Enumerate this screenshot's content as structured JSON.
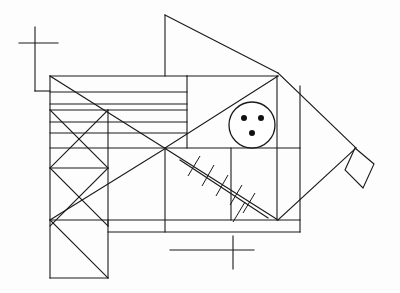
{
  "figure": {
    "background_color": "#fdfdfd",
    "stroke_color": "#1a1a1a",
    "canvas": {
      "width": 400,
      "height": 293
    },
    "parts": [
      {
        "name": "upper-left-cross-marker",
        "label": "cross"
      },
      {
        "name": "lower-cross-marker",
        "label": "cross"
      },
      {
        "name": "dorsal-fin",
        "label": "dorsal fin"
      },
      {
        "name": "body-outline",
        "label": "body"
      },
      {
        "name": "eye",
        "label": "eye"
      },
      {
        "name": "gill-hatching",
        "label": "hatched fin"
      },
      {
        "name": "tail-diamond",
        "label": "tail"
      },
      {
        "name": "pectoral-box",
        "label": "lower fin box"
      }
    ]
  },
  "geometry": {
    "cross_top": {
      "cx": 35,
      "cy": 43,
      "h_x1": 19,
      "h_x2": 58,
      "v_y1": 27,
      "v_y2": 91
    },
    "cross_top_stub": {
      "x1": 35,
      "y1": 91,
      "x2": 50,
      "y2": 91
    },
    "cross_bottom": {
      "cx": 233,
      "cy": 250,
      "h_x1": 196,
      "h_x2": 254,
      "v_y1": 236,
      "v_y2": 269
    },
    "cross_bottom_stub": {
      "x1": 196,
      "y1": 250,
      "x2": 170,
      "y2": 250
    },
    "body": {
      "top_y": 76,
      "mid_y": 148,
      "bottom_y": 220,
      "left_x": 50,
      "right_x": 300,
      "nose_x": 277,
      "nose_y": 73,
      "tail_x": 355,
      "tail_y": 148
    },
    "horizontal_lines": [
      {
        "x1": 50,
        "y1": 76,
        "x2": 187,
        "y2": 76
      },
      {
        "x1": 50,
        "y1": 92,
        "x2": 187,
        "y2": 92
      },
      {
        "x1": 50,
        "y1": 104,
        "x2": 187,
        "y2": 104
      },
      {
        "x1": 50,
        "y1": 110,
        "x2": 187,
        "y2": 110
      },
      {
        "x1": 50,
        "y1": 122,
        "x2": 187,
        "y2": 122
      },
      {
        "x1": 50,
        "y1": 133,
        "x2": 187,
        "y2": 133
      },
      {
        "x1": 50,
        "y1": 148,
        "x2": 300,
        "y2": 148
      },
      {
        "x1": 50,
        "y1": 220,
        "x2": 300,
        "y2": 220
      },
      {
        "x1": 108,
        "y1": 232,
        "x2": 300,
        "y2": 232
      }
    ],
    "vertical_lines": [
      {
        "x1": 50,
        "y1": 76,
        "x2": 50,
        "y2": 278
      },
      {
        "x1": 108,
        "y1": 110,
        "x2": 108,
        "y2": 220
      },
      {
        "x1": 108,
        "y1": 220,
        "x2": 108,
        "y2": 278
      },
      {
        "x1": 165,
        "y1": 15,
        "x2": 165,
        "y2": 76
      },
      {
        "x1": 187,
        "y1": 76,
        "x2": 187,
        "y2": 148
      },
      {
        "x1": 165,
        "y1": 148,
        "x2": 165,
        "y2": 232
      },
      {
        "x1": 231,
        "y1": 148,
        "x2": 231,
        "y2": 220
      },
      {
        "x1": 277,
        "y1": 76,
        "x2": 277,
        "y2": 220
      },
      {
        "x1": 300,
        "y1": 85,
        "x2": 300,
        "y2": 232
      }
    ],
    "diagonals": [
      {
        "x1": 165,
        "y1": 15,
        "x2": 277,
        "y2": 73
      },
      {
        "x1": 165,
        "y1": 15,
        "x2": 165,
        "y2": 76
      },
      {
        "x1": 50,
        "y1": 76,
        "x2": 165,
        "y2": 148
      },
      {
        "x1": 165,
        "y1": 148,
        "x2": 277,
        "y2": 76
      },
      {
        "x1": 165,
        "y1": 148,
        "x2": 50,
        "y2": 220
      },
      {
        "x1": 165,
        "y1": 148,
        "x2": 277,
        "y2": 220
      },
      {
        "x1": 277,
        "y1": 73,
        "x2": 355,
        "y2": 148
      },
      {
        "x1": 277,
        "y1": 220,
        "x2": 355,
        "y2": 148
      },
      {
        "x1": 50,
        "y1": 220,
        "x2": 108,
        "y2": 278
      },
      {
        "x1": 50,
        "y1": 110,
        "x2": 108,
        "y2": 168
      },
      {
        "x1": 108,
        "y1": 110,
        "x2": 50,
        "y2": 168
      },
      {
        "x1": 50,
        "y1": 168,
        "x2": 108,
        "y2": 226
      },
      {
        "x1": 108,
        "y1": 168,
        "x2": 50,
        "y2": 226
      }
    ],
    "hatch_line": {
      "x1": 180,
      "y1": 160,
      "x2": 268,
      "y2": 218,
      "ticks": 6
    },
    "eye": {
      "cx": 252,
      "cy": 125,
      "r": 23,
      "dots": [
        {
          "cx": 244,
          "cy": 118,
          "r": 3
        },
        {
          "cx": 261,
          "cy": 118,
          "r": 3
        },
        {
          "cx": 252,
          "cy": 133,
          "r": 3
        }
      ]
    },
    "tail_diamond": [
      {
        "x": 355,
        "y": 148
      },
      {
        "x": 345,
        "y": 170
      },
      {
        "x": 363,
        "y": 188
      },
      {
        "x": 374,
        "y": 164
      }
    ]
  }
}
